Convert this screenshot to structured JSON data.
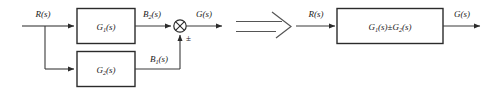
{
  "figure": {
    "kind": "control-system-block-diagram",
    "background_color": "#ffffff",
    "line_color": "#3a3a3a",
    "block_border_color": "#2b2b2b",
    "text_color": "#1a1a1a"
  },
  "left_diagram": {
    "input_label": "R(s)",
    "blocks": [
      {
        "id": "g1",
        "label_base": "G",
        "label_sub": "1",
        "label_tail": "(s)"
      },
      {
        "id": "g2",
        "label_base": "G",
        "label_sub": "2",
        "label_tail": "(s)"
      }
    ],
    "signal_labels": {
      "g1_output_base": "B",
      "g1_output_sub": "2",
      "g1_output_tail": "(s)",
      "g2_output_base": "B",
      "g2_output_sub": "1",
      "g2_output_tail": "(s)"
    },
    "summing_junction": {
      "name": "summing-junction",
      "style": "circle-with-cross",
      "sign_label": "±"
    },
    "output_label": "G(s)"
  },
  "transition": {
    "symbol_name": "double-line-implication-arrow",
    "meaning": "reduces to"
  },
  "right_diagram": {
    "input_label": "R(s)",
    "block": {
      "id": "g-combined",
      "term1_base": "G",
      "term1_sub": "1",
      "term1_tail": "(s)",
      "operator": "±",
      "term2_base": "G",
      "term2_sub": "2",
      "term2_tail": "(s)"
    },
    "output_label": "G(s)"
  }
}
